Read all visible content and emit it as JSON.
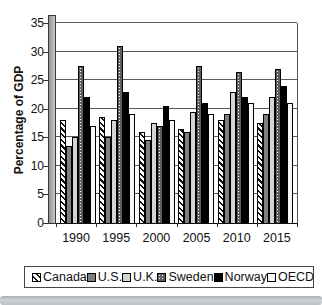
{
  "chart_data": {
    "type": "bar",
    "title": "",
    "ylabel": "Percentage of GDP",
    "xlabel": "",
    "ylim": [
      0,
      35
    ],
    "y_ticks": [
      0,
      5,
      10,
      15,
      20,
      25,
      30,
      35
    ],
    "grid": true,
    "legend_position": "bottom",
    "categories": [
      "1990",
      "1995",
      "2000",
      "2005",
      "2010",
      "2015"
    ],
    "series": [
      {
        "name": "Canada",
        "pattern": "diagonal-stripes",
        "color": "#ffffff",
        "values": [
          18,
          18.5,
          16,
          16.5,
          18,
          17.5
        ]
      },
      {
        "name": "U.S.",
        "pattern": "solid-dark-gray",
        "color": "#7f7f7f",
        "values": [
          13.5,
          15,
          14.5,
          16,
          19,
          19
        ]
      },
      {
        "name": "U.K.",
        "pattern": "solid-light-gray",
        "color": "#d4d4d4",
        "values": [
          15,
          18,
          17.5,
          19.5,
          23,
          22
        ]
      },
      {
        "name": "Sweden",
        "pattern": "white-speckle-on-dark",
        "color": "#5e5e5e",
        "values": [
          27.5,
          31,
          17,
          27.5,
          26.5,
          27
        ]
      },
      {
        "name": "Norway",
        "pattern": "solid-black",
        "color": "#000000",
        "values": [
          22,
          23,
          20.5,
          21,
          22,
          24
        ]
      },
      {
        "name": "OECD",
        "pattern": "dotted-white",
        "color": "#f7f7f7",
        "values": [
          17,
          19,
          18,
          19,
          21,
          21
        ]
      }
    ]
  }
}
